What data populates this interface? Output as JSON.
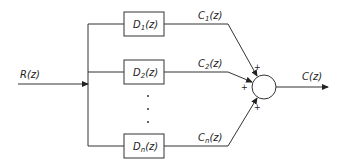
{
  "diagram": {
    "type": "parallel-block-diagram",
    "input": {
      "label": "R(z)",
      "base": "R",
      "arg": "(z)"
    },
    "output": {
      "label": "C(z)",
      "base": "C",
      "arg": "(z)"
    },
    "blocks": [
      {
        "label": "D1(z)",
        "base": "D",
        "sub": "1",
        "arg": "(z)",
        "out": {
          "base": "C",
          "sub": "1",
          "arg": "(z)"
        },
        "sign": "+"
      },
      {
        "label": "D2(z)",
        "base": "D",
        "sub": "2",
        "arg": "(z)",
        "out": {
          "base": "C",
          "sub": "2",
          "arg": "(z)"
        },
        "sign": "+"
      },
      {
        "label": "Dn(z)",
        "base": "D",
        "sub": "n",
        "arg": "(z)",
        "out": {
          "base": "C",
          "sub": "n",
          "arg": "(z)"
        },
        "sign": "+"
      }
    ],
    "ellipsis": "·",
    "summing_junction": {
      "signs": [
        "+",
        "+",
        "+"
      ]
    },
    "colors": {
      "line": "#333333",
      "background": "#ffffff"
    }
  }
}
